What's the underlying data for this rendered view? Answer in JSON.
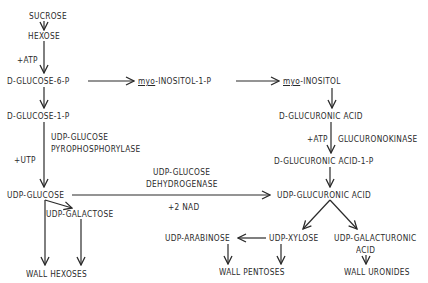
{
  "diagram": {
    "type": "metabolic-pathway",
    "nodes": {
      "sucrose": "SUCROSE",
      "hexose": "HEXOSE",
      "atp1": "+ATP",
      "glucose6p": "D-GLUCOSE-6-P",
      "myo_prefix_1": "myo",
      "inositol1p": "-INOSITOL-1-P",
      "myo_prefix_2": "myo",
      "inositol": "-INOSITOL",
      "glucose1p": "D-GLUCOSE-1-P",
      "pyro_enzyme_line1": "UDP-GLUCOSE",
      "pyro_enzyme_line2": "PYROPHOSPHORYLASE",
      "utp": "+UTP",
      "udp_glucose": "UDP-GLUCOSE",
      "dehydro_enzyme_line1": "UDP-GLUCOSE",
      "dehydro_enzyme_line2": "DEHYDROGENASE",
      "nad": "+2 NAD",
      "udp_galactose": "UDP-GALACTOSE",
      "wall_hexoses": "WALL HEXOSES",
      "glucuronic_acid": "D-GLUCURONIC ACID",
      "atp2": "+ATP",
      "glucuronokinase": "GLUCURONOKINASE",
      "glucuronic_acid_1p": "D-GLUCURONIC ACID-1-P",
      "udp_glucuronic_acid": "UDP-GLUCURONIC ACID",
      "udp_arabinose": "UDP-ARABINOSE",
      "udp_xylose": "UDP-XYLOSE",
      "udp_galacturonic_line1": "UDP-GALACTURONIC",
      "udp_galacturonic_line2": "ACID",
      "wall_pentoses": "WALL PENTOSES",
      "wall_uronides": "WALL URONIDES"
    },
    "edges": [
      {
        "from": "SUCROSE",
        "to": "HEXOSE"
      },
      {
        "from": "HEXOSE",
        "to": "D-GLUCOSE-6-P",
        "cofactor": "+ATP"
      },
      {
        "from": "D-GLUCOSE-6-P",
        "to": "myo-INOSITOL-1-P"
      },
      {
        "from": "myo-INOSITOL-1-P",
        "to": "myo-INOSITOL"
      },
      {
        "from": "D-GLUCOSE-6-P",
        "to": "D-GLUCOSE-1-P"
      },
      {
        "from": "D-GLUCOSE-1-P",
        "to": "UDP-GLUCOSE",
        "cofactor": "+UTP",
        "enzyme": "UDP-GLUCOSE PYROPHOSPHORYLASE"
      },
      {
        "from": "UDP-GLUCOSE",
        "to": "UDP-GLUCURONIC ACID",
        "cofactor": "+2 NAD",
        "enzyme": "UDP-GLUCOSE DEHYDROGENASE"
      },
      {
        "from": "UDP-GLUCOSE",
        "to": "UDP-GALACTOSE"
      },
      {
        "from": "UDP-GLUCOSE",
        "to": "WALL HEXOSES"
      },
      {
        "from": "UDP-GALACTOSE",
        "to": "WALL HEXOSES"
      },
      {
        "from": "myo-INOSITOL",
        "to": "D-GLUCURONIC ACID"
      },
      {
        "from": "D-GLUCURONIC ACID",
        "to": "D-GLUCURONIC ACID-1-P",
        "cofactor": "+ATP",
        "enzyme": "GLUCURONOKINASE"
      },
      {
        "from": "D-GLUCURONIC ACID-1-P",
        "to": "UDP-GLUCURONIC ACID"
      },
      {
        "from": "UDP-GLUCURONIC ACID",
        "to": "UDP-XYLOSE"
      },
      {
        "from": "UDP-GLUCURONIC ACID",
        "to": "UDP-GALACTURONIC ACID"
      },
      {
        "from": "UDP-XYLOSE",
        "to": "UDP-ARABINOSE"
      },
      {
        "from": "UDP-ARABINOSE",
        "to": "WALL PENTOSES"
      },
      {
        "from": "UDP-XYLOSE",
        "to": "WALL PENTOSES"
      },
      {
        "from": "UDP-GALACTURONIC ACID",
        "to": "WALL URONIDES"
      }
    ],
    "colors": {
      "ink": "#2a2a2a",
      "background": "#ffffff"
    }
  }
}
